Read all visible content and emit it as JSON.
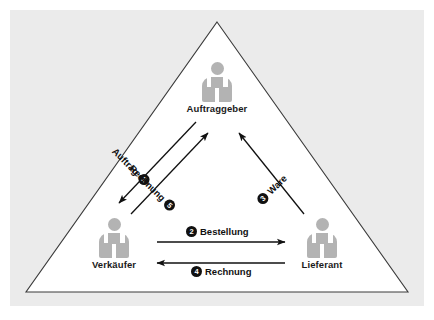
{
  "figure": {
    "panel_color": "#ebebeb",
    "triangle_fill": "#ffffff",
    "triangle_stroke": "#3a3a3a",
    "icon_color": "#b3b3b3",
    "badge_color": "#111111",
    "arrow_color": "#111111"
  },
  "actors": [
    {
      "id": "auftraggeber",
      "label": "Auftraggeber",
      "icon": "person-icon",
      "position": "top"
    },
    {
      "id": "verkaeufer",
      "label": "Verkäufer",
      "icon": "person-icon",
      "position": "bottom-left"
    },
    {
      "id": "lieferant",
      "label": "Lieferant",
      "icon": "person-icon",
      "position": "bottom-right"
    }
  ],
  "flows": [
    {
      "id": "auftrag",
      "number": "1",
      "badge": "❶",
      "label": "Auftrag",
      "from": "Auftraggeber",
      "to": "Verkäufer",
      "direction": "down-left"
    },
    {
      "id": "bestellung",
      "number": "2",
      "badge": "❷",
      "label": "Bestellung",
      "from": "Verkäufer",
      "to": "Lieferant",
      "direction": "right"
    },
    {
      "id": "ware",
      "number": "3",
      "badge": "❸",
      "label": "Ware",
      "from": "Lieferant",
      "to": "Auftraggeber",
      "direction": "up-left"
    },
    {
      "id": "rechnung-lieferant",
      "number": "4",
      "badge": "❹",
      "label": "Rechnung",
      "from": "Lieferant",
      "to": "Verkäufer",
      "direction": "left"
    },
    {
      "id": "rechnung-verkaeufer",
      "number": "5",
      "badge": "❺",
      "label": "Rechnung",
      "from": "Verkäufer",
      "to": "Auftraggeber",
      "direction": "up-right"
    }
  ]
}
